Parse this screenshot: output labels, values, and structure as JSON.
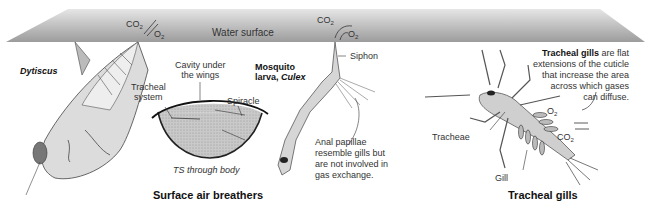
{
  "water_surface": {
    "label": "Water surface",
    "color_light": "#e8e8e8",
    "color_dark": "#9a9a9a"
  },
  "gas_labels": {
    "co2": "CO",
    "o2": "O",
    "sub2": "2"
  },
  "dytiscus": {
    "name": "Dytiscus"
  },
  "cross_section": {
    "tracheal_system_line1": "Tracheal",
    "tracheal_system_line2": "system",
    "cavity_line1": "Cavity under",
    "cavity_line2": "the wings",
    "spiracle": "Spiracle",
    "caption": "TS through body"
  },
  "mosquito": {
    "name_line1": "Mosquito",
    "name_line2_prefix": "larva, ",
    "name_line2_genus": "Culex",
    "siphon": "Siphon",
    "anal_note_line1": "Anal papillae",
    "anal_note_line2": "resemble gills but",
    "anal_note_line3": "are not involved in",
    "anal_note_line4": "gas exchange."
  },
  "tracheal_gills": {
    "desc_bold": "Tracheal gills",
    "desc_line1_rest": " are flat",
    "desc_line2": "extensions of the cuticle",
    "desc_line3": "that increase the area",
    "desc_line4": "across which gases",
    "desc_line5": "can diffuse.",
    "tracheae": "Tracheae",
    "gill": "Gill"
  },
  "section_titles": {
    "surface_air_breathers": "Surface air breathers",
    "tracheal_gills": "Tracheal gills"
  }
}
